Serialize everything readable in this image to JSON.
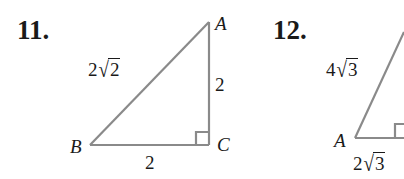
{
  "problems": [
    {
      "number": "11.",
      "vertices": {
        "A": "A",
        "B": "B",
        "C": "C"
      },
      "sides": {
        "hypotenuse_AB": {
          "coef": "2",
          "radical": "√",
          "radicand": "2"
        },
        "leg_AC": "2",
        "leg_BC": "2"
      },
      "right_angle_at": "C"
    },
    {
      "number": "12.",
      "vertices": {
        "A": "A"
      },
      "sides": {
        "hypotenuse": {
          "coef": "4",
          "radical": "√",
          "radicand": "3"
        },
        "leg_bottom": {
          "coef": "2",
          "radical": "√",
          "radicand": "3"
        }
      },
      "right_angle_at": "bottom-right (cropped)"
    }
  ],
  "colors": {
    "line": "#8a8a8a",
    "text": "#1a1a1a",
    "background": "#ffffff"
  }
}
